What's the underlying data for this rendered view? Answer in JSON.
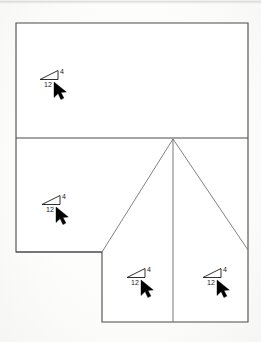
{
  "drawing": {
    "title": "Roof Plan",
    "line_color": "#4a4a4a",
    "symbol_color": "#1a1a1a",
    "cursor_color": "#000000",
    "background_color": "#fdfdfc",
    "outline": {
      "name": "roof-outline",
      "points": "16,23 248,23 248,322 102,322 102,252 16,252"
    },
    "interior_lines": [
      {
        "name": "eave-line-upper",
        "x1": 16,
        "y1": 138,
        "x2": 248,
        "y2": 138
      },
      {
        "name": "eave-line-lower",
        "x1": 16,
        "y1": 252,
        "x2": 102,
        "y2": 252
      },
      {
        "name": "hip-line-left",
        "x1": 173,
        "y1": 139,
        "x2": 102,
        "y2": 252
      },
      {
        "name": "ridge-line-center",
        "x1": 173,
        "y1": 139,
        "x2": 173,
        "y2": 322
      },
      {
        "name": "hip-line-right",
        "x1": 173,
        "y1": 139,
        "x2": 248,
        "y2": 250
      }
    ],
    "slope_symbols": [
      {
        "name": "slope-symbol-north",
        "rise": "4",
        "run": "12",
        "x": 40,
        "y": 70,
        "arrow_x": 54,
        "arrow_y": 82
      },
      {
        "name": "slope-symbol-west",
        "rise": "4",
        "run": "12",
        "x": 42,
        "y": 195,
        "arrow_x": 56,
        "arrow_y": 207
      },
      {
        "name": "slope-symbol-south-left",
        "rise": "4",
        "run": "12",
        "x": 127,
        "y": 268,
        "arrow_x": 141,
        "arrow_y": 280
      },
      {
        "name": "slope-symbol-south-right",
        "rise": "4",
        "run": "12",
        "x": 203,
        "y": 268,
        "arrow_x": 217,
        "arrow_y": 280
      }
    ]
  }
}
